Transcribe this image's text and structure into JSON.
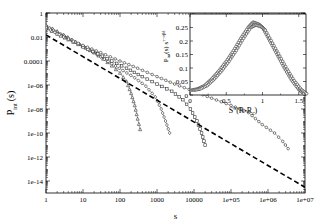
{
  "chart_data": [
    {
      "type": "scatter",
      "title": "",
      "xlabel": "s",
      "ylabel": "P_int (s)",
      "xscale": "log",
      "yscale": "log",
      "xlim": [
        1,
        10000000
      ],
      "ylim": [
        1e-15,
        1
      ],
      "grid": false,
      "x_ticks": [
        "1",
        "10",
        "100",
        "1000",
        "10000",
        "1e+05",
        "1e+06",
        "1e+07"
      ],
      "y_ticks": [
        "1",
        "0.01",
        "0.0001",
        "1e-06",
        "1e-08",
        "1e-10",
        "1e-12",
        "1e-14"
      ],
      "series": [
        {
          "name": "triangles (small R)",
          "marker": "triangle",
          "line": "thin solid",
          "points": [
            [
              1,
              0.1
            ],
            [
              1.5,
              0.05
            ],
            [
              2,
              0.03
            ],
            [
              3,
              0.015
            ],
            [
              5,
              0.006
            ],
            [
              8,
              0.0025
            ],
            [
              12,
              0.0012
            ],
            [
              20,
              0.0005
            ],
            [
              35,
              0.00015
            ],
            [
              60,
              4e-05
            ],
            [
              100,
              1e-05
            ],
            [
              150,
              2e-06
            ],
            [
              200,
              2e-07
            ],
            [
              250,
              2e-08
            ],
            [
              300,
              1.5e-09
            ],
            [
              350,
              2e-10
            ]
          ]
        },
        {
          "name": "diamonds (medium R)",
          "marker": "diamond",
          "line": "thin solid",
          "points": [
            [
              1,
              0.08
            ],
            [
              2,
              0.025
            ],
            [
              4,
              0.008
            ],
            [
              8,
              0.0025
            ],
            [
              15,
              0.0008
            ],
            [
              30,
              0.00022
            ],
            [
              60,
              6e-05
            ],
            [
              120,
              1.6e-05
            ],
            [
              250,
              4e-06
            ],
            [
              500,
              8e-07
            ],
            [
              900,
              1e-07
            ],
            [
              1300,
              1e-08
            ],
            [
              1700,
              1e-09
            ],
            [
              2200,
              1e-10
            ]
          ]
        },
        {
          "name": "squares (larger R)",
          "marker": "square",
          "line": "thin solid",
          "points": [
            [
              1,
              0.05
            ],
            [
              2,
              0.018
            ],
            [
              4,
              0.006
            ],
            [
              10,
              0.0015
            ],
            [
              25,
              0.0004
            ],
            [
              60,
              0.0001
            ],
            [
              150,
              2.5e-05
            ],
            [
              400,
              5e-06
            ],
            [
              1000,
              1.2e-06
            ],
            [
              2500,
              3e-07
            ],
            [
              5000,
              6e-08
            ],
            [
              8000,
              1e-08
            ],
            [
              12000,
              1e-09
            ],
            [
              16000,
              1e-10
            ],
            [
              20000,
              1e-11
            ]
          ]
        },
        {
          "name": "circles (largest R)",
          "marker": "circle",
          "line": "thin solid",
          "points": [
            [
              1,
              0.06
            ],
            [
              3,
              0.01
            ],
            [
              10,
              0.002
            ],
            [
              30,
              0.0005
            ],
            [
              100,
              0.0001
            ],
            [
              300,
              2.5e-05
            ],
            [
              1000,
              5e-06
            ],
            [
              3000,
              1.2e-06
            ],
            [
              10000,
              3e-07
            ],
            [
              30000,
              8e-08
            ],
            [
              100000,
              2e-08
            ],
            [
              300000,
              5e-09
            ],
            [
              700000,
              5e-10
            ],
            [
              1500000,
              1e-10
            ],
            [
              2500000,
              2e-11
            ],
            [
              3500000,
              5e-12
            ]
          ]
        },
        {
          "name": "power-law fit",
          "marker": "none",
          "line": "dashed bold",
          "points": [
            [
              1,
              0.015
            ],
            [
              10000000,
              3e-15
            ]
          ]
        }
      ]
    },
    {
      "type": "scatter",
      "title": "",
      "xlabel": "S^σ(R-R_c)",
      "ylabel": "P_int(s) s^{τ+σβδ}",
      "xlim": [
        0,
        1.6
      ],
      "ylim": [
        0,
        0.3
      ],
      "x_ticks": [
        "0",
        "0.5",
        "1",
        "1.5"
      ],
      "y_ticks": [
        "0",
        "0.05",
        "0.1",
        "0.15",
        "0.2",
        "0.25"
      ],
      "series": [
        {
          "name": "scaling collapse",
          "marker": "circle",
          "points": [
            [
              0.02,
              0.018
            ],
            [
              0.1,
              0.022
            ],
            [
              0.2,
              0.035
            ],
            [
              0.3,
              0.06
            ],
            [
              0.4,
              0.09
            ],
            [
              0.5,
              0.125
            ],
            [
              0.6,
              0.165
            ],
            [
              0.7,
              0.21
            ],
            [
              0.8,
              0.25
            ],
            [
              0.87,
              0.27
            ],
            [
              0.95,
              0.262
            ],
            [
              1.0,
              0.25
            ],
            [
              1.1,
              0.2
            ],
            [
              1.2,
              0.15
            ],
            [
              1.3,
              0.1
            ],
            [
              1.4,
              0.055
            ],
            [
              1.5,
              0.02
            ],
            [
              1.57,
              0.005
            ]
          ]
        }
      ]
    }
  ],
  "main": {
    "xlabel": "s",
    "ylabel_main": "P",
    "ylabel_sub": "int",
    "ylabel_tail": "(s)",
    "x_ticks": [
      "1",
      "10",
      "100",
      "1000",
      "10000",
      "1e+05",
      "1e+06",
      "1e+07"
    ],
    "y_ticks": [
      "1",
      "0.01",
      "0.0001",
      "1e-06",
      "1e-08",
      "1e-10",
      "1e-12",
      "1e-14"
    ]
  },
  "inset": {
    "xlabel_main": "S",
    "xlabel_sup": "σ",
    "xlabel_tail": "(R-R",
    "xlabel_sub": "c",
    "xlabel_close": ")",
    "ylabel_main": "P",
    "ylabel_sub": "int",
    "ylabel_mid": "(s) s",
    "ylabel_sup": "τ+σβδ",
    "x_ticks": [
      "0",
      "0.5",
      "1",
      "1.5"
    ],
    "y_ticks": [
      "0",
      "0.05",
      "0.1",
      "0.15",
      "0.2",
      "0.25"
    ]
  }
}
